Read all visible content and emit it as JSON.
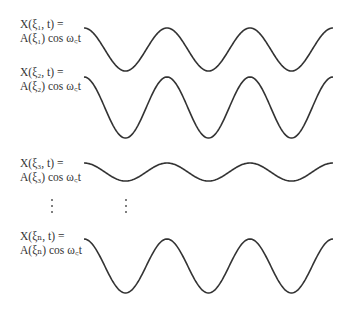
{
  "rows": [
    {
      "line1": "X(ξ₁, t) =",
      "line2": "A(ξ₁) cos ω꜀t",
      "label_top": 17,
      "center_y": 49.5,
      "amplitude": 21.5
    },
    {
      "line1": "X(ξ₂, t) =",
      "line2": "A(ξ₂) cos ω꜀t",
      "label_top": 65,
      "center_y": 107.5,
      "amplitude": 30.5
    },
    {
      "line1": "X(ξ₃, t) =",
      "line2": "A(ξ₃) cos ω꜀t",
      "label_top": 156,
      "center_y": 172,
      "amplitude": 9
    },
    {
      "line1": "X(ξₙ, t) =",
      "line2": "A(ξₙ) cos ω꜀t",
      "label_top": 229,
      "center_y": 266,
      "amplitude": 27
    }
  ],
  "wave": {
    "x_start": 84,
    "x_end": 333,
    "period": 83,
    "stroke": "#333333"
  },
  "ellipsis": [
    {
      "x": 51,
      "y_top": 199,
      "y_bottom": 213
    },
    {
      "x": 125,
      "y_top": 199,
      "y_bottom": 213
    }
  ]
}
